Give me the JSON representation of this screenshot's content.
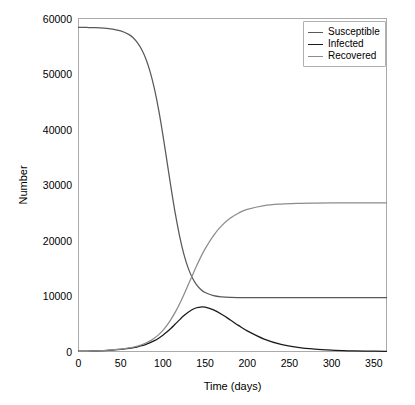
{
  "chart_data": {
    "type": "line",
    "title": "",
    "xlabel": "Time (days)",
    "ylabel": "Number",
    "xlim": [
      0,
      365
    ],
    "ylim": [
      0,
      60000
    ],
    "grid": false,
    "legend_position": "upper right",
    "xticks": [
      0,
      50,
      100,
      150,
      200,
      250,
      300,
      350
    ],
    "xtick_labels": [
      "0",
      "50",
      "100",
      "150",
      "200",
      "250",
      "300",
      "350"
    ],
    "yticks": [
      0,
      10000,
      20000,
      30000,
      40000,
      50000,
      60000
    ],
    "ytick_labels": [
      "0",
      "10000",
      "20000",
      "30000",
      "40000",
      "50000",
      "60000"
    ],
    "x": [
      0,
      10,
      20,
      30,
      40,
      50,
      60,
      65,
      70,
      75,
      80,
      85,
      90,
      95,
      100,
      105,
      110,
      115,
      120,
      125,
      130,
      135,
      140,
      145,
      150,
      160,
      170,
      180,
      190,
      200,
      220,
      240,
      260,
      280,
      300,
      320,
      340,
      365
    ],
    "series": [
      {
        "name": "Susceptible",
        "color": "#595959",
        "values": [
          58400,
          58380,
          58340,
          58260,
          58100,
          57770,
          57090,
          56480,
          55600,
          54370,
          52660,
          50350,
          47320,
          43520,
          39030,
          34120,
          29180,
          24600,
          20650,
          17460,
          15020,
          13250,
          12010,
          11180,
          10640,
          10070,
          9840,
          9750,
          9720,
          9710,
          9700,
          9700,
          9700,
          9700,
          9700,
          9700,
          9700,
          9700
        ]
      },
      {
        "name": "Infected",
        "color": "#1a1a1a",
        "values": [
          60,
          75,
          110,
          165,
          245,
          370,
          560,
          690,
          850,
          1050,
          1290,
          1590,
          1960,
          2400,
          2930,
          3550,
          4240,
          4990,
          5750,
          6470,
          7090,
          7570,
          7880,
          8010,
          7980,
          7500,
          6680,
          5680,
          4660,
          3720,
          2240,
          1290,
          730,
          410,
          230,
          130,
          72,
          35
        ]
      },
      {
        "name": "Recovered",
        "color": "#8c8c8c",
        "values": [
          0,
          40,
          95,
          170,
          275,
          420,
          640,
          790,
          980,
          1220,
          1530,
          1920,
          2420,
          3040,
          3810,
          4750,
          5870,
          7180,
          8660,
          10290,
          12010,
          13760,
          15460,
          17050,
          18500,
          20890,
          22720,
          24040,
          24960,
          25600,
          26290,
          26570,
          26690,
          26740,
          26760,
          26770,
          26780,
          26790
        ]
      }
    ]
  },
  "legend": {
    "entries": [
      {
        "label": "Susceptible"
      },
      {
        "label": "Infected"
      },
      {
        "label": "Recovered"
      }
    ]
  },
  "axes": {
    "frame_color": "#aaaaaa"
  }
}
